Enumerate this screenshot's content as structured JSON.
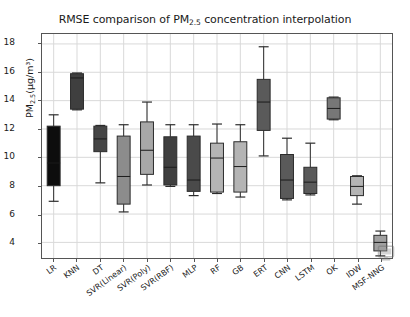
{
  "chart_data": {
    "type": "box",
    "title": "RMSE comparison of PM2.5 concentration interpolation",
    "title_main_pre": "RMSE comparison of PM",
    "title_sub": "2.5",
    "title_main_post": " concentration interpolation",
    "xlabel": "",
    "ylabel": "PM2.5(μg/m³)",
    "ylabel_pre": "PM",
    "ylabel_sub": "2.5",
    "ylabel_post": "(μg/m³)",
    "ylim": [
      2.9,
      18.7
    ],
    "yticks": [
      4,
      6,
      8,
      10,
      12,
      14,
      16,
      18
    ],
    "ytick_labels": [
      "4",
      "6",
      "8",
      "10",
      "12",
      "14",
      "16",
      "18"
    ],
    "grid": true,
    "grid_color": "#d9d9d9",
    "legend": "none",
    "categories": [
      "LR",
      "KNN",
      "DT",
      "SVR(Linear)",
      "SVR(Poly)",
      "SVR(RBF)",
      "MLP",
      "RF",
      "GB",
      "ERT",
      "CNN",
      "LSTM",
      "OK",
      "IDW",
      "MSF-NNG"
    ],
    "boxes": [
      {
        "label": "LR",
        "whisker_low": 6.9,
        "q1": 8.0,
        "median": 9.6,
        "q3": 12.2,
        "whisker_high": 13.0,
        "color": "#0d0d0d"
      },
      {
        "label": "KNN",
        "whisker_low": 13.35,
        "q1": 13.4,
        "median": 15.6,
        "q3": 15.9,
        "whisker_high": 15.95,
        "color": "#3f3f3f"
      },
      {
        "label": "DT",
        "whisker_low": 8.2,
        "q1": 10.4,
        "median": 11.3,
        "q3": 12.2,
        "whisker_high": 12.25,
        "color": "#464646"
      },
      {
        "label": "SVR(Linear)",
        "whisker_low": 6.15,
        "q1": 6.7,
        "median": 8.65,
        "q3": 11.5,
        "whisker_high": 12.3,
        "color": "#8c8c8c"
      },
      {
        "label": "SVR(Poly)",
        "whisker_low": 8.05,
        "q1": 8.8,
        "median": 10.5,
        "q3": 12.5,
        "whisker_high": 13.9,
        "color": "#a8a8a8"
      },
      {
        "label": "SVR(RBF)",
        "whisker_low": 7.95,
        "q1": 8.05,
        "median": 9.3,
        "q3": 11.45,
        "whisker_high": 12.3,
        "color": "#3f3f3f"
      },
      {
        "label": "MLP",
        "whisker_low": 7.3,
        "q1": 7.6,
        "median": 8.4,
        "q3": 11.5,
        "whisker_high": 12.3,
        "color": "#4a4a4a"
      },
      {
        "label": "RF",
        "whisker_low": 7.45,
        "q1": 7.55,
        "median": 9.95,
        "q3": 11.0,
        "whisker_high": 12.35,
        "color": "#b4b4b4"
      },
      {
        "label": "GB",
        "whisker_low": 7.2,
        "q1": 7.55,
        "median": 9.35,
        "q3": 11.1,
        "whisker_high": 12.3,
        "color": "#b4b4b4"
      },
      {
        "label": "ERT",
        "whisker_low": 10.1,
        "q1": 11.9,
        "median": 13.9,
        "q3": 15.5,
        "whisker_high": 17.8,
        "color": "#5a5a5a"
      },
      {
        "label": "CNN",
        "whisker_low": 7.0,
        "q1": 7.1,
        "median": 8.4,
        "q3": 10.2,
        "whisker_high": 11.35,
        "color": "#5a5a5a"
      },
      {
        "label": "LSTM",
        "whisker_low": 7.35,
        "q1": 7.45,
        "median": 8.25,
        "q3": 9.3,
        "whisker_high": 11.0,
        "color": "#5a5a5a"
      },
      {
        "label": "OK",
        "whisker_low": 12.65,
        "q1": 12.7,
        "median": 13.45,
        "q3": 14.2,
        "whisker_high": 14.25,
        "color": "#777777"
      },
      {
        "label": "IDW",
        "whisker_low": 6.7,
        "q1": 7.3,
        "median": 7.95,
        "q3": 8.65,
        "whisker_high": 8.7,
        "color": "#b4b4b4"
      },
      {
        "label": "MSF-NNG",
        "whisker_low": 3.05,
        "q1": 3.4,
        "median": 4.0,
        "q3": 4.5,
        "whisker_high": 4.8,
        "color": "#a0a0a0"
      }
    ]
  },
  "watermark": {
    "icon_name": "monitor-icon"
  }
}
